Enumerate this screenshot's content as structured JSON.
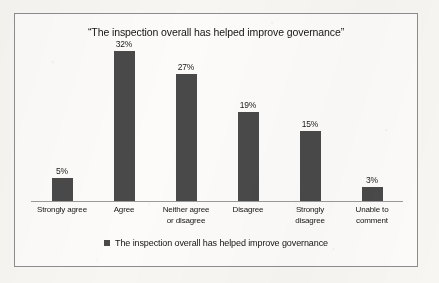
{
  "chart_data": {
    "type": "bar",
    "title": "“The inspection overall has helped improve governance”",
    "xlabel": "",
    "ylabel": "",
    "ylim": [
      0,
      35
    ],
    "grid": false,
    "legend_position": "bottom",
    "bar_color": "#494949",
    "axis_color": "#9a9a9a",
    "categories": [
      "Strongly agree",
      "Agree",
      "Neither agree or disagree",
      "Disagree",
      "Strongly disagree",
      "Unable to comment"
    ],
    "category_lines": [
      [
        "Strongly agree"
      ],
      [
        "Agree"
      ],
      [
        "Neither agree",
        "or disagree"
      ],
      [
        "Disagree"
      ],
      [
        "Strongly",
        "disagree"
      ],
      [
        "Unable to",
        "comment"
      ]
    ],
    "values": [
      5,
      32,
      27,
      19,
      15,
      3
    ],
    "value_labels": [
      "5%",
      "32%",
      "27%",
      "19%",
      "15%",
      "3%"
    ],
    "series": [
      {
        "name": "The inspection overall has helped improve governance",
        "values": [
          5,
          32,
          27,
          19,
          15,
          3
        ]
      }
    ],
    "legend": [
      {
        "label": "The inspection overall has helped improve governance",
        "color": "#494949"
      }
    ]
  }
}
